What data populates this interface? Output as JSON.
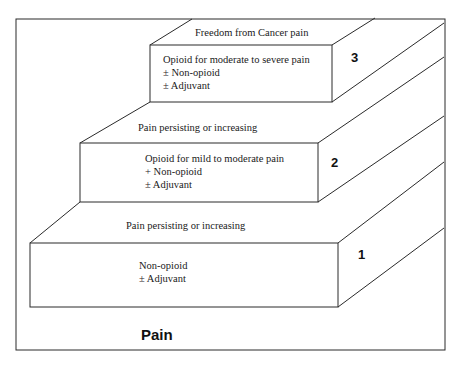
{
  "diagram": {
    "type": "staircase",
    "bottom_label": "Pain",
    "top_label": "Freedom from Cancer pain",
    "steps": [
      {
        "number": "1",
        "lines": [
          "Non-opioid",
          "± Adjuvant"
        ],
        "transition_label": "Pain persisting or increasing"
      },
      {
        "number": "2",
        "lines": [
          "Opioid for mild to moderate pain",
          "+ Non-opioid",
          "± Adjuvant"
        ],
        "transition_label": "Pain persisting or increasing"
      },
      {
        "number": "3",
        "lines": [
          "Opioid for moderate to severe pain",
          "± Non-opioid",
          "± Adjuvant"
        ]
      }
    ]
  }
}
